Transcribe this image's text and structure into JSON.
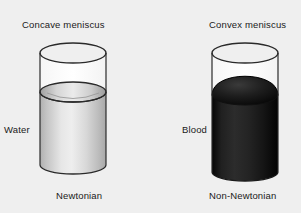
{
  "figure": {
    "background_color": "#efefef",
    "width": 301,
    "height": 213,
    "panels": [
      {
        "id": "left",
        "title": "Concave meniscus",
        "substance": "Water",
        "caption": "Newtonian",
        "fluid_color": "#c9c9c9",
        "meniscus_shape": "concave",
        "container": "glass-cylinder"
      },
      {
        "id": "right",
        "title": "Convex meniscus",
        "substance": "Blood",
        "caption": "Non-Newtonian",
        "fluid_color": "#141414",
        "meniscus_shape": "convex",
        "container": "glass-cylinder"
      }
    ]
  },
  "colors": {
    "outline": "#1a1a1a",
    "text": "#1a1a1a",
    "water_light": "#e8e8e8",
    "water_dark": "#b4b4b4",
    "blood_light": "#2e2e2e",
    "blood_dark": "#000000"
  }
}
